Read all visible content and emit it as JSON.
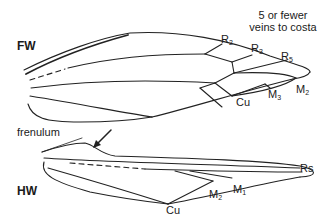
{
  "diagram": {
    "type": "insect wing venation (Lepidoptera)",
    "forewing": {
      "label": "FW",
      "annotation_line1": "5 or fewer",
      "annotation_line2": "veins to costa",
      "veins": [
        {
          "base": "R",
          "sub": "2"
        },
        {
          "base": "R",
          "sub": "3"
        },
        {
          "base": "R",
          "sub": "5"
        },
        {
          "base": "M",
          "sub": "2"
        },
        {
          "base": "M",
          "sub": "3"
        },
        {
          "base": "Cu",
          "sub": ""
        }
      ]
    },
    "hindwing": {
      "label": "HW",
      "frenulum_label": "frenulum",
      "veins": [
        {
          "base": "Rs",
          "sub": ""
        },
        {
          "base": "M",
          "sub": "1"
        },
        {
          "base": "M",
          "sub": "2"
        },
        {
          "base": "Cu",
          "sub": ""
        }
      ]
    },
    "stroke_color": "#222222",
    "background_color": "#ffffff"
  }
}
